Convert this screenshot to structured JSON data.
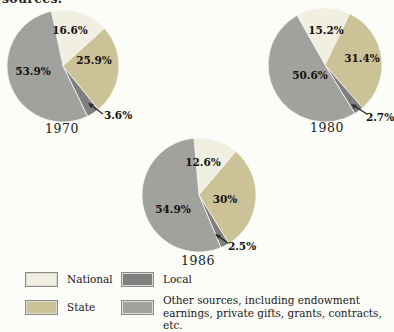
{
  "page": {
    "caption_partial": "sources."
  },
  "colors": {
    "national": "#f0efe1",
    "state": "#cbc298",
    "local": "#7f7f7f",
    "other": "#a1a19e"
  },
  "chart_data": [
    {
      "type": "pie",
      "title": "1970",
      "center": [
        63,
        66
      ],
      "radius": 56,
      "start_angle": 102,
      "title_xy": [
        62,
        128
      ],
      "slices": [
        {
          "key": "national",
          "label": "National",
          "value": 16.6,
          "text": "16.6%",
          "label_xy": [
            70,
            30
          ]
        },
        {
          "key": "state",
          "label": "State",
          "value": 25.9,
          "text": "25.9%",
          "label_xy": [
            94,
            60
          ]
        },
        {
          "key": "local",
          "label": "Local",
          "value": 3.6,
          "text": "3.6%",
          "label_xy": [
            118,
            115
          ],
          "outside": true
        },
        {
          "key": "other",
          "label": "Other sources",
          "value": 53.9,
          "text": "53.9%",
          "label_xy": [
            33,
            71
          ]
        }
      ],
      "arrow": {
        "from": [
          103,
          114
        ],
        "to": [
          88,
          103
        ]
      }
    },
    {
      "type": "pie",
      "title": "1980",
      "center": [
        325,
        65
      ],
      "radius": 57,
      "start_angle": 119,
      "title_xy": [
        327,
        127
      ],
      "slices": [
        {
          "key": "national",
          "label": "National",
          "value": 15.2,
          "text": "15.2%",
          "label_xy": [
            326,
            30
          ]
        },
        {
          "key": "state",
          "label": "State",
          "value": 31.4,
          "text": "31.4%",
          "label_xy": [
            362,
            58
          ]
        },
        {
          "key": "local",
          "label": "Local",
          "value": 2.7,
          "text": "2.7%",
          "label_xy": [
            380,
            117
          ],
          "outside": true
        },
        {
          "key": "other",
          "label": "Other sources",
          "value": 50.6,
          "text": "50.6%",
          "label_xy": [
            310,
            75
          ]
        }
      ],
      "arrow": {
        "from": [
          367,
          114
        ],
        "to": [
          351,
          104
        ]
      }
    },
    {
      "type": "pie",
      "title": "1986",
      "center": [
        199,
        195
      ],
      "radius": 57,
      "start_angle": 95,
      "title_xy": [
        198,
        260
      ],
      "slices": [
        {
          "key": "national",
          "label": "National",
          "value": 12.6,
          "text": "12.6%",
          "label_xy": [
            203,
            162
          ]
        },
        {
          "key": "state",
          "label": "State",
          "value": 30,
          "text": "30%",
          "label_xy": [
            225,
            199
          ]
        },
        {
          "key": "local",
          "label": "Local",
          "value": 2.5,
          "text": "2.5%",
          "label_xy": [
            242,
            246
          ],
          "outside": true
        },
        {
          "key": "other",
          "label": "Other sources",
          "value": 54.9,
          "text": "54.9%",
          "label_xy": [
            173,
            209
          ]
        }
      ],
      "arrow": {
        "from": [
          228,
          243
        ],
        "to": [
          215,
          234
        ]
      }
    }
  ],
  "legend": {
    "items": [
      {
        "key": "national",
        "label": "National"
      },
      {
        "key": "local",
        "label": "Local"
      },
      {
        "key": "state",
        "label": "State"
      },
      {
        "key": "other",
        "label": "Other sources, including endowment earnings, private gifts, grants, contracts, etc.",
        "label_lines": [
          "Other sources, including endowment",
          "earnings, private gifts, grants, contracts, etc."
        ]
      }
    ]
  }
}
